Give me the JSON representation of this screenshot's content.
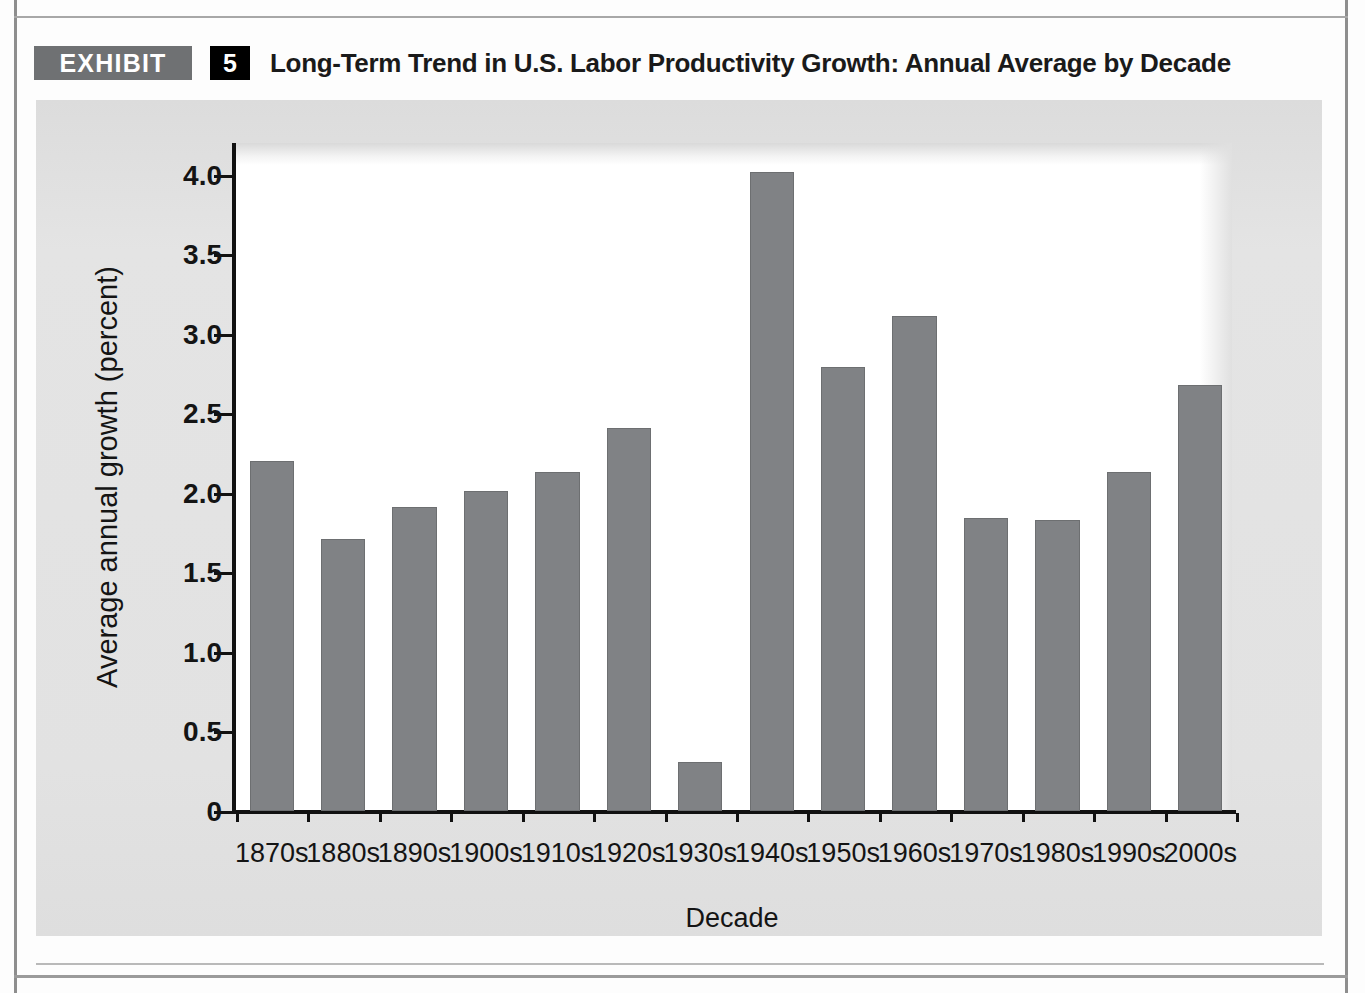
{
  "exhibit": {
    "badge_label": "EXHIBIT",
    "number": "5",
    "title": "Long-Term Trend in U.S. Labor Productivity Growth: Annual Average by Decade"
  },
  "colors": {
    "bar_fill": "#808285",
    "bar_stroke": "#6d6f71",
    "panel_background": "#e2e2e2",
    "plot_background": "#ffffff",
    "axis": "#111111",
    "badge_grey": "#6f7173",
    "number_black": "#000000",
    "text": "#141414"
  },
  "chart_data": {
    "type": "bar",
    "title": "Long-Term Trend in U.S. Labor Productivity Growth: Annual Average by Decade",
    "xlabel": "Decade",
    "ylabel": "Average annual growth (percent)",
    "ylim": [
      0,
      4.2
    ],
    "ytick_labels": [
      "0",
      "0.5",
      "1.0",
      "1.5",
      "2.0",
      "2.5",
      "3.0",
      "3.5",
      "4.0"
    ],
    "ytick_values": [
      0,
      0.5,
      1.0,
      1.5,
      2.0,
      2.5,
      3.0,
      3.5,
      4.0
    ],
    "grid": false,
    "legend": false,
    "categories": [
      "1870s",
      "1880s",
      "1890s",
      "1900s",
      "1910s",
      "1920s",
      "1930s",
      "1940s",
      "1950s",
      "1960s",
      "1970s",
      "1980s",
      "1990s",
      "2000s"
    ],
    "values": [
      2.2,
      1.71,
      1.91,
      2.01,
      2.13,
      2.41,
      0.31,
      4.02,
      2.79,
      3.11,
      1.84,
      1.83,
      2.13,
      2.68
    ]
  }
}
